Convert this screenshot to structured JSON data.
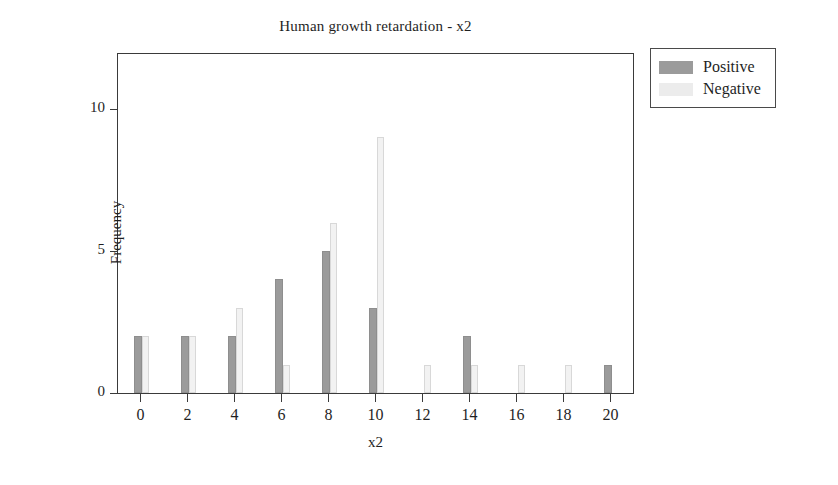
{
  "chart_data": {
    "type": "bar",
    "title": "Human growth retardation - x2",
    "xlabel": "x2",
    "ylabel": "Frequency",
    "categories": [
      "0",
      "2",
      "4",
      "6",
      "8",
      "10",
      "12",
      "14",
      "16",
      "18",
      "20"
    ],
    "xtick_labels": [
      "0",
      "2",
      "4",
      "6",
      "8",
      "10",
      "12",
      "14",
      "16",
      "18",
      "20"
    ],
    "ytick_labels": [
      "0",
      "5",
      "10"
    ],
    "ytick_values": [
      0,
      5,
      10
    ],
    "xlim": [
      -1,
      21
    ],
    "ylim": [
      0,
      12
    ],
    "grid": false,
    "legend_position": "outside-top-right",
    "series": [
      {
        "name": "Positive",
        "color": "#9b9b9b",
        "values": [
          2,
          2,
          2,
          4,
          5,
          3,
          0,
          2,
          0,
          0,
          1
        ]
      },
      {
        "name": "Negative",
        "color": "#ececec",
        "values": [
          2,
          2,
          3,
          1,
          6,
          9,
          1,
          1,
          1,
          1,
          0
        ]
      }
    ]
  },
  "legend": {
    "entries": [
      {
        "label": "Positive"
      },
      {
        "label": "Negative"
      }
    ]
  }
}
